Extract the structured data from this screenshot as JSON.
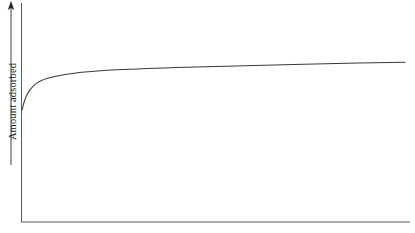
{
  "figure": {
    "type": "line-plot",
    "background_color": "#ffffff",
    "line_color": "#3a3a3a",
    "axis_color": "#555555"
  },
  "axes": {
    "y_axis": {
      "label": "Amount adsorbed",
      "arrow_direction": "up",
      "has_ticks": false,
      "has_tick_labels": false
    },
    "x_axis": {
      "label": "",
      "has_ticks": false,
      "has_tick_labels": false
    }
  },
  "chart_data": {
    "type": "line",
    "title": "",
    "subtitle": "",
    "xlabel": "",
    "ylabel": "Amount adsorbed",
    "xlim": [
      0,
      1
    ],
    "ylim": [
      0,
      1
    ],
    "grid": false,
    "legend": null,
    "annotations": [],
    "series": [
      {
        "name": "adsorption isotherm",
        "color": "#3a3a3a",
        "x": [
          0.0,
          0.004,
          0.01,
          0.018,
          0.028,
          0.041,
          0.057,
          0.077,
          0.103,
          0.134,
          0.17,
          0.211,
          0.257,
          0.308,
          0.365,
          0.426,
          0.492,
          0.562,
          0.636,
          0.714,
          0.795,
          0.88,
          0.94,
          0.987
        ],
        "y": [
          0.512,
          0.57,
          0.625,
          0.666,
          0.697,
          0.721,
          0.74,
          0.755,
          0.768,
          0.779,
          0.789,
          0.798,
          0.806,
          0.814,
          0.821,
          0.828,
          0.834,
          0.84,
          0.846,
          0.851,
          0.856,
          0.861,
          0.864,
          0.866
        ]
      }
    ]
  },
  "curve_path": "M 22,110.1 C 23.2,104.5 24.6,99.8 26.3,96.0 C 28.4,91.4 30.9,87.9 33.9,85.3 C 37.6,82.1 42.2,79.9 47.6,78.3 C 54.6,76.2 62.8,74.7 72.3,73.4 C 85.0,71.8 99.6,70.7 116.1,69.8 C 137.0,68.8 160.4,68.0 186.3,67.2 C 218.6,66.3 254.3,65.4 293.4,64.4 C 330.0,63.5 368.0,62.8 405,62.2"
}
